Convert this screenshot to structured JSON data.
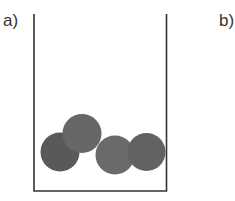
{
  "panels": [
    {
      "label": "a)",
      "container": {
        "left_wall_x": 34,
        "right_wall_x": 166.5,
        "top_y": 14,
        "bottom_y": 191,
        "stroke_color": "#333333",
        "stroke_width": 1.6
      },
      "particles": [
        {
          "cx": 60,
          "cy": 152,
          "r": 19.5,
          "fill": "#595959"
        },
        {
          "cx": 82,
          "cy": 133.5,
          "r": 19.5,
          "fill": "#676767"
        },
        {
          "cx": 115,
          "cy": 155,
          "r": 19.5,
          "fill": "#6a6a6a"
        },
        {
          "cx": 146.5,
          "cy": 152,
          "r": 19,
          "fill": "#626262"
        }
      ]
    },
    {
      "label": "b)"
    }
  ]
}
